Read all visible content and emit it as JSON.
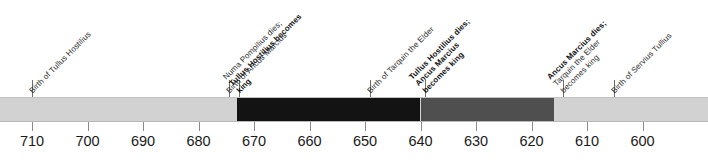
{
  "chart_data": {
    "type": "timeline",
    "title": "",
    "xlabel": "",
    "ylabel": "",
    "axis": {
      "orientation": "horizontal",
      "direction": "descending",
      "era": "BC",
      "range_start": 710,
      "range_end": 600,
      "tick_step": 10,
      "ticks": [
        710,
        700,
        690,
        680,
        670,
        660,
        650,
        640,
        630,
        620,
        610,
        600
      ],
      "tick_labels": [
        "710",
        "700",
        "690",
        "680",
        "670",
        "660",
        "650",
        "640",
        "630",
        "620",
        "610",
        "600"
      ],
      "grid": false,
      "legend": "none"
    },
    "bar": {
      "baseline_color": "#d2d2d2",
      "segments": [
        {
          "name": "pre-reign-light",
          "start_year": 710,
          "end_year": 673,
          "color": "#d2d2d2",
          "ruler": ""
        },
        {
          "name": "reign-of-tullus-hostilius",
          "start_year": 673,
          "end_year": 640,
          "color": "#131313",
          "ruler": "Tullus Hostilius"
        },
        {
          "name": "reign-of-ancus-marcius",
          "start_year": 640,
          "end_year": 616,
          "color": "#4f4f4f",
          "ruler": "Ancus Marcius"
        },
        {
          "name": "post-reign-light",
          "start_year": 616,
          "end_year": 600,
          "color": "#d2d2d2",
          "ruler": ""
        }
      ]
    },
    "events": [
      {
        "id": "birth-of-tullus-hostilius",
        "year": 710,
        "x": 32,
        "lines": [
          {
            "text": "Birth of Tullus Hostilius",
            "bold": false
          }
        ]
      },
      {
        "id": "birth-of-ancus-marcius",
        "year": 675,
        "x": 229,
        "lines": [
          {
            "text": "Birth of Ancus Marcius",
            "bold": false
          }
        ]
      },
      {
        "id": "numa-dies-tullus-becomes-king",
        "year": 673,
        "x": 239,
        "lines": [
          {
            "text": "Numa Pompilius dies;",
            "bold": false
          },
          {
            "text": "Tullus Hostilius becomes",
            "bold": true
          },
          {
            "text": "king",
            "bold": true
          }
        ]
      },
      {
        "id": "birth-of-tarquin-the-elder",
        "year": 650,
        "x": 370,
        "lines": [
          {
            "text": "Birth of Tarquin the Elder",
            "bold": false
          }
        ]
      },
      {
        "id": "tullus-dies-ancus-becomes-king",
        "year": 640,
        "x": 425,
        "lines": [
          {
            "text": "Tullus Hostilius dies;",
            "bold": true
          },
          {
            "text": "Ancus Marcius",
            "bold": true
          },
          {
            "text": "becomes king",
            "bold": true
          }
        ]
      },
      {
        "id": "ancus-dies-tarquin-becomes-king",
        "year": 616,
        "x": 563,
        "lines": [
          {
            "text": "Ancus Marcius dies;",
            "bold": true
          },
          {
            "text": "Tarquin the Elder",
            "bold": false
          },
          {
            "text": "becomes king",
            "bold": false
          }
        ]
      },
      {
        "id": "birth-of-servius-tullius",
        "year": 607,
        "x": 614,
        "lines": [
          {
            "text": "Birth of Servius Tullius",
            "bold": false
          }
        ]
      }
    ]
  },
  "layout": {
    "axis_x_start_px": 32,
    "px_per_decade": 55.5,
    "bar_top_px": 97,
    "bar_height_px": 25,
    "label_anchor_y_px": 95
  }
}
